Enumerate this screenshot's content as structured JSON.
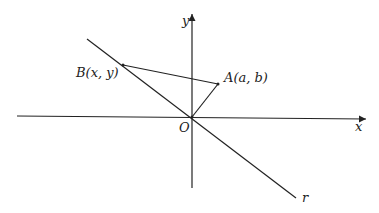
{
  "diagram": {
    "labels": {
      "y_axis": "y",
      "x_axis": "x",
      "origin": "O",
      "point_b": "B(x, y)",
      "point_a": "A(a, b)",
      "line_r": "r"
    }
  }
}
